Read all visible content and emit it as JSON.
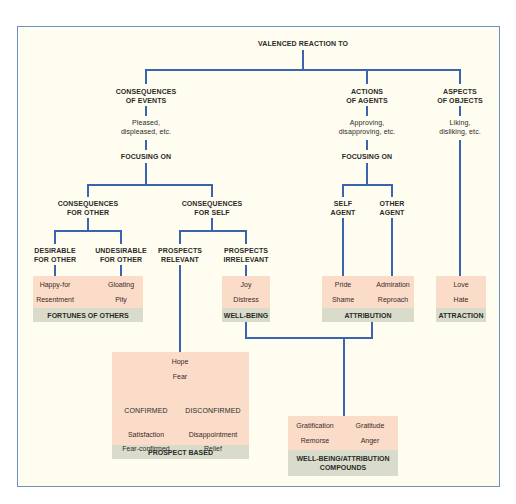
{
  "root": {
    "label": "VALENCED REACTION TO"
  },
  "branches": {
    "events": {
      "title": [
        "CONSEQUENCES",
        "OF EVENTS"
      ],
      "reaction": [
        "Pleased,",
        "displeased, etc."
      ],
      "focus": "FOCUSING ON",
      "for_other": {
        "title": [
          "CONSEQUENCES",
          "FOR OTHER"
        ],
        "desirable": [
          "DESIRABLE",
          "FOR OTHER"
        ],
        "undesirable": [
          "UNDESIRABLE",
          "FOR OTHER"
        ]
      },
      "for_self": {
        "title": [
          "CONSEQUENCES",
          "FOR SELF"
        ],
        "relevant": [
          "PROSPECTS",
          "RELEVANT"
        ],
        "irrelevant": [
          "PROSPECTS",
          "IRRELEVANT"
        ]
      }
    },
    "agents": {
      "title": [
        "ACTIONS",
        "OF AGENTS"
      ],
      "reaction": [
        "Approving,",
        "disapproving, etc."
      ],
      "focus": "FOCUSING ON",
      "self": [
        "SELF",
        "AGENT"
      ],
      "other": [
        "OTHER",
        "AGENT"
      ]
    },
    "objects": {
      "title": [
        "ASPECTS",
        "OF OBJECTS"
      ],
      "reaction": [
        "Liking,",
        "disliking, etc."
      ]
    }
  },
  "groups": {
    "fortunes": {
      "emotions": [
        "Happy-for",
        "Gloating",
        "Resentment",
        "Pity"
      ],
      "caption": "FORTUNES OF OTHERS"
    },
    "wellbeing": {
      "emotions": [
        "Joy",
        "Distress"
      ],
      "caption": "WELL-BEING"
    },
    "attribution": {
      "emotions": [
        "Pride",
        "Admiration",
        "Shame",
        "Reproach"
      ],
      "caption": "ATTRIBUTION"
    },
    "attraction": {
      "emotions": [
        "Love",
        "Hate"
      ],
      "caption": "ATTRACTION"
    },
    "prospect": {
      "emotions_top": [
        "Hope",
        "Fear"
      ],
      "confirmed": "CONFIRMED",
      "disconfirmed": "DISCONFIRMED",
      "emotions": [
        "Satisfaction",
        "Disappointment",
        "Fear-confirmed",
        "Relief"
      ],
      "caption": "PROSPECT BASED"
    },
    "compounds": {
      "emotions": [
        "Gratification",
        "Gratitude",
        "Remorse",
        "Anger"
      ],
      "caption": [
        "WELL-BEING/ATTRIBUTION",
        "COMPOUNDS"
      ]
    }
  },
  "colors": {
    "line": "#3a64b0",
    "inner_line": "#c0508a",
    "emotion_box": "#fbdcc8",
    "caption_band": "#d9dccb",
    "background": "#fffdf0",
    "frame": "#6e8fbf"
  }
}
